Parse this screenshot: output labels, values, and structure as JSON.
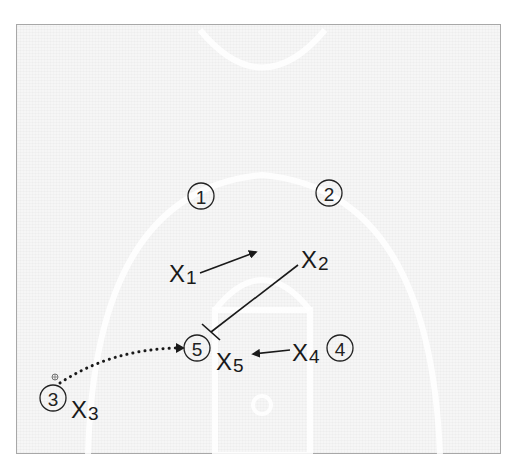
{
  "diagram": {
    "type": "basketball-play",
    "colors": {
      "frame_border": "#a8a8a8",
      "court_background": "#f6f6f6",
      "court_lines": "#ffffff",
      "ink": "#1a1a1a"
    },
    "offense": [
      {
        "id": "1",
        "label": "1",
        "x": 201,
        "y": 196
      },
      {
        "id": "2",
        "label": "2",
        "x": 329,
        "y": 193
      },
      {
        "id": "3",
        "label": "3",
        "x": 53,
        "y": 398,
        "has_ball": true
      },
      {
        "id": "4",
        "label": "4",
        "x": 340,
        "y": 348
      },
      {
        "id": "5",
        "label": "5",
        "x": 197,
        "y": 348
      }
    ],
    "defense": [
      {
        "id": "X1",
        "letter": "X",
        "sub": "1",
        "x": 169,
        "y": 282
      },
      {
        "id": "X2",
        "letter": "X",
        "sub": "2",
        "x": 301,
        "y": 268
      },
      {
        "id": "X3",
        "letter": "X",
        "sub": "3",
        "x": 71,
        "y": 418
      },
      {
        "id": "X4",
        "letter": "X",
        "sub": "4",
        "x": 292,
        "y": 361
      },
      {
        "id": "X5",
        "letter": "X",
        "sub": "5",
        "x": 216,
        "y": 370
      }
    ],
    "actions": [
      {
        "type": "movement",
        "from": "X1",
        "to": [
          257,
          252
        ]
      },
      {
        "type": "screen",
        "from": "X2",
        "to": [
          211,
          331
        ]
      },
      {
        "type": "movement",
        "from": "X4",
        "to": [
          252,
          353
        ]
      },
      {
        "type": "pass",
        "from": "3",
        "to": "5"
      }
    ],
    "ball_symbol": "basketball-icon"
  }
}
